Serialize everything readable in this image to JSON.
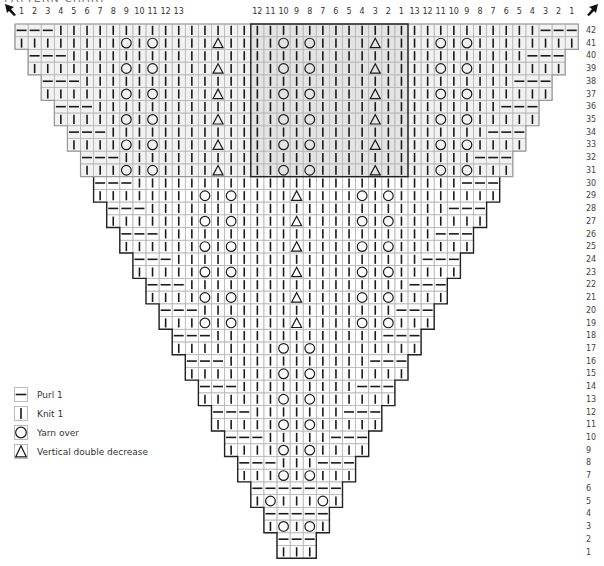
{
  "title": "PATTERN CHART",
  "grid": {
    "origin_x": 15,
    "origin_y": 24,
    "cell_w": 13.1,
    "cell_h": 12.72,
    "total_cols": 43,
    "total_rows": 42,
    "center_col": 22
  },
  "header_labels": {
    "left_block": [
      "1",
      "2",
      "3",
      "4",
      "5",
      "6",
      "7",
      "8",
      "9",
      "10",
      "11",
      "12",
      "13"
    ],
    "left_block_start_col": 1,
    "center_block": [
      "12",
      "11",
      "10",
      "9",
      "8",
      "7",
      "6",
      "5",
      "4",
      "3",
      "2",
      "1"
    ],
    "center_block_start_col": 19,
    "right_block": [
      "13",
      "12",
      "11",
      "10",
      "9",
      "8",
      "7",
      "6",
      "5",
      "4",
      "3",
      "2",
      "1"
    ],
    "right_block_start_col": 31
  },
  "row_labels": [
    "1",
    "2",
    "3",
    "4",
    "5",
    "6",
    "7",
    "8",
    "9",
    "10",
    "11",
    "12",
    "13",
    "14",
    "15",
    "16",
    "17",
    "18",
    "19",
    "20",
    "21",
    "22",
    "23",
    "24",
    "25",
    "26",
    "27",
    "28",
    "29",
    "30",
    "31",
    "32",
    "33",
    "34",
    "35",
    "36",
    "37",
    "38",
    "39",
    "40",
    "41",
    "42"
  ],
  "highlight_box": {
    "col_start": 19,
    "col_end": 30,
    "row_top": 42,
    "row_bottom": 31,
    "fill": "#e6e6e6"
  },
  "upper_panel": {
    "col_start": 1,
    "col_end": 43,
    "row_top": 42,
    "row_bottom": 31,
    "fill": "#f2f2f2"
  },
  "stitch_rules": {
    "edge_purls_even_rows": 3,
    "all_purl_rows": [
      2,
      4,
      6
    ],
    "special": [
      {
        "rows": [
          3
        ],
        "yo_cols": [
          21,
          23
        ],
        "dd_cols": []
      },
      {
        "rows": [
          5
        ],
        "yo_cols": [
          20,
          24
        ],
        "dd_cols": []
      },
      {
        "rows": [
          7,
          9,
          11,
          13,
          15,
          17
        ],
        "yo_cols": [
          21,
          23
        ],
        "dd_cols": []
      },
      {
        "rows": [
          19,
          21,
          23,
          25,
          27,
          29
        ],
        "yo_cols": [
          15,
          17,
          27,
          29
        ],
        "dd_cols": [
          22
        ]
      },
      {
        "rows": [
          31,
          33,
          35,
          37,
          39,
          41
        ],
        "yo_cols": [
          9,
          11,
          21,
          23,
          33,
          35
        ],
        "dd_cols": [
          16,
          28
        ]
      }
    ]
  },
  "legend": {
    "items": [
      {
        "symbol": "purl",
        "label": "Purl 1"
      },
      {
        "symbol": "knit",
        "label": "Knit 1"
      },
      {
        "symbol": "yo",
        "label": "Yarn over"
      },
      {
        "symbol": "dd",
        "label": "Vertical double decrease"
      }
    ]
  },
  "colors": {
    "grid_line": "#b8b8b8",
    "outline": "#222222",
    "symbol": "#1a1a1a",
    "panel_fill": "#f2f2f2",
    "box_fill": "#e4e4e4"
  },
  "arrows": {
    "left": "arrow-up-left",
    "right": "arrow-up-right"
  }
}
